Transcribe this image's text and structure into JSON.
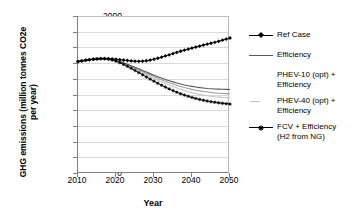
{
  "chart_data": {
    "type": "line",
    "title": "",
    "xlabel": "Year",
    "ylabel_line1": "GHG emissions (million tonnes CO2e",
    "ylabel_line2": "per year)",
    "ylabel": "GHG emissions (million tonnes CO2e per year)",
    "xlim": [
      2010,
      2050
    ],
    "ylim": [
      0,
      2000
    ],
    "grid": true,
    "legend_position": "right",
    "xticks": [
      "2010",
      "2020",
      "2030",
      "2040",
      "2050"
    ],
    "xtick_values": [
      2010,
      2020,
      2030,
      2040,
      2050
    ],
    "yticks": [
      "0",
      "200",
      "400",
      "600",
      "800",
      "1000",
      "1200",
      "1400",
      "1600",
      "1800",
      "2000"
    ],
    "ytick_values": [
      0,
      200,
      400,
      600,
      800,
      1000,
      1200,
      1400,
      1600,
      1800,
      2000
    ],
    "x": [
      2010,
      2011,
      2012,
      2013,
      2014,
      2015,
      2016,
      2017,
      2018,
      2019,
      2020,
      2021,
      2022,
      2023,
      2024,
      2025,
      2026,
      2027,
      2028,
      2029,
      2030,
      2031,
      2032,
      2033,
      2034,
      2035,
      2036,
      2037,
      2038,
      2039,
      2040,
      2041,
      2042,
      2043,
      2044,
      2045,
      2046,
      2047,
      2048,
      2049,
      2050
    ],
    "series": [
      {
        "name": "Ref Case",
        "color": "#000000",
        "marker": "diamond",
        "values": [
          1420,
          1428,
          1436,
          1443,
          1449,
          1453,
          1456,
          1457,
          1456,
          1453,
          1449,
          1444,
          1438,
          1433,
          1428,
          1424,
          1423,
          1425,
          1430,
          1438,
          1449,
          1462,
          1476,
          1491,
          1506,
          1521,
          1536,
          1551,
          1565,
          1578,
          1591,
          1604,
          1617,
          1629,
          1641,
          1653,
          1665,
          1678,
          1692,
          1706,
          1720
        ]
      },
      {
        "name": "Efficiency",
        "color": "#595959",
        "marker": "none",
        "values": [
          1420,
          1428,
          1436,
          1443,
          1449,
          1453,
          1456,
          1457,
          1453,
          1445,
          1434,
          1420,
          1404,
          1386,
          1367,
          1347,
          1327,
          1306,
          1286,
          1266,
          1246,
          1227,
          1209,
          1192,
          1176,
          1161,
          1147,
          1134,
          1122,
          1112,
          1103,
          1095,
          1088,
          1082,
          1077,
          1073,
          1070,
          1068,
          1066,
          1065,
          1064
        ]
      },
      {
        "name": "PHEV-10 (opt) +\nEfficiency",
        "color": "#9e9e9e",
        "marker": "none",
        "values": [
          1420,
          1428,
          1436,
          1443,
          1449,
          1453,
          1456,
          1457,
          1452,
          1443,
          1431,
          1416,
          1398,
          1379,
          1358,
          1337,
          1315,
          1293,
          1271,
          1249,
          1228,
          1207,
          1187,
          1168,
          1150,
          1133,
          1117,
          1102,
          1088,
          1076,
          1065,
          1055,
          1046,
          1038,
          1031,
          1025,
          1020,
          1016,
          1013,
          1011,
          1010
        ]
      },
      {
        "name": "PHEV-40 (opt) +\nEfficiency",
        "color": "#c4c4c4",
        "marker": "none",
        "values": [
          1420,
          1428,
          1436,
          1443,
          1449,
          1453,
          1456,
          1457,
          1451,
          1441,
          1428,
          1411,
          1392,
          1371,
          1348,
          1325,
          1301,
          1277,
          1253,
          1229,
          1206,
          1183,
          1161,
          1140,
          1120,
          1101,
          1083,
          1066,
          1050,
          1036,
          1023,
          1011,
          1001,
          992,
          984,
          977,
          971,
          967,
          964,
          962,
          960
        ]
      },
      {
        "name": "FCV + Efficiency\n(H2 from NG)",
        "color": "#000000",
        "marker": "asterisk",
        "values": [
          1420,
          1428,
          1436,
          1443,
          1449,
          1453,
          1456,
          1457,
          1450,
          1439,
          1424,
          1405,
          1383,
          1359,
          1333,
          1306,
          1279,
          1251,
          1223,
          1196,
          1169,
          1143,
          1118,
          1094,
          1071,
          1049,
          1029,
          1010,
          993,
          977,
          962,
          949,
          937,
          926,
          917,
          908,
          901,
          894,
          888,
          883,
          878
        ]
      }
    ]
  },
  "legend": {
    "items": [
      {
        "label": "Ref Case",
        "key": "line-diamond"
      },
      {
        "label": "Efficiency",
        "key": "line-plain"
      },
      {
        "label": "PHEV-10 (opt) +\nEfficiency",
        "key": "none"
      },
      {
        "label": "PHEV-40 (opt) +\nEfficiency",
        "key": "line-faint"
      },
      {
        "label": "FCV + Efficiency\n(H2 from NG)",
        "key": "line-asterisk"
      }
    ]
  },
  "colors": {
    "ref_case": "#000000",
    "efficiency": "#595959",
    "phev10": "#9e9e9e",
    "phev40": "#c4c4c4",
    "fcv": "#000000",
    "grid": "#d9d9d9",
    "axis": "#808080"
  }
}
